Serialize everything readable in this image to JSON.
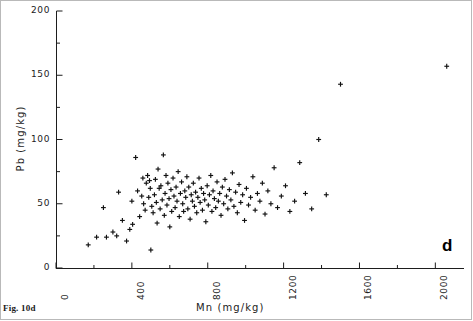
{
  "figure": {
    "caption": "Fig. 10d",
    "panel_letter": "d"
  },
  "chart_data": {
    "type": "scatter",
    "title": "",
    "xlabel": "Mn (mg/kg)",
    "ylabel": "Pb (mg/kg)",
    "xlim": [
      0,
      2130
    ],
    "ylim": [
      0,
      200
    ],
    "xticks": [
      0,
      400,
      800,
      1200,
      1600,
      2000
    ],
    "xtick_labels": [
      "0",
      "400",
      "800",
      "1200",
      "1600",
      "2000"
    ],
    "x_minor_tick_step": 200,
    "yticks": [
      0,
      50,
      100,
      150,
      200
    ],
    "ytick_labels": [
      "0",
      "50",
      "100",
      "150",
      "200"
    ],
    "y_minor_tick_step": 25,
    "grid": false,
    "legend": null,
    "marker": "plus",
    "marker_color": "#111111",
    "series": [
      {
        "name": "Samples",
        "points": [
          [
            170,
            18
          ],
          [
            214,
            24
          ],
          [
            250,
            47
          ],
          [
            266,
            24
          ],
          [
            300,
            28
          ],
          [
            320,
            25
          ],
          [
            350,
            37
          ],
          [
            330,
            59
          ],
          [
            372,
            21
          ],
          [
            389,
            30
          ],
          [
            400,
            52
          ],
          [
            404,
            34
          ],
          [
            420,
            86
          ],
          [
            430,
            60
          ],
          [
            441,
            40
          ],
          [
            452,
            56
          ],
          [
            458,
            70
          ],
          [
            462,
            50
          ],
          [
            470,
            45
          ],
          [
            476,
            66
          ],
          [
            483,
            72
          ],
          [
            489,
            55
          ],
          [
            493,
            68
          ],
          [
            497,
            62
          ],
          [
            500,
            14
          ],
          [
            505,
            48
          ],
          [
            512,
            43
          ],
          [
            519,
            57
          ],
          [
            524,
            69
          ],
          [
            529,
            51
          ],
          [
            533,
            35
          ],
          [
            538,
            77
          ],
          [
            544,
            62
          ],
          [
            549,
            46
          ],
          [
            553,
            64
          ],
          [
            560,
            53
          ],
          [
            566,
            88
          ],
          [
            571,
            41
          ],
          [
            575,
            58
          ],
          [
            580,
            72
          ],
          [
            585,
            49
          ],
          [
            590,
            66
          ],
          [
            596,
            54
          ],
          [
            600,
            32
          ],
          [
            606,
            61
          ],
          [
            610,
            44
          ],
          [
            617,
            70
          ],
          [
            622,
            56
          ],
          [
            628,
            47
          ],
          [
            633,
            63
          ],
          [
            638,
            52
          ],
          [
            644,
            75
          ],
          [
            650,
            40
          ],
          [
            656,
            58
          ],
          [
            662,
            67
          ],
          [
            668,
            50
          ],
          [
            673,
            44
          ],
          [
            679,
            60
          ],
          [
            684,
            55
          ],
          [
            690,
            71
          ],
          [
            695,
            46
          ],
          [
            700,
            63
          ],
          [
            707,
            38
          ],
          [
            713,
            57
          ],
          [
            719,
            52
          ],
          [
            724,
            66
          ],
          [
            730,
            48
          ],
          [
            736,
            59
          ],
          [
            742,
            43
          ],
          [
            748,
            55
          ],
          [
            754,
            70
          ],
          [
            760,
            51
          ],
          [
            766,
            62
          ],
          [
            772,
            45
          ],
          [
            778,
            58
          ],
          [
            784,
            53
          ],
          [
            790,
            36
          ],
          [
            797,
            64
          ],
          [
            803,
            49
          ],
          [
            809,
            57
          ],
          [
            816,
            72
          ],
          [
            822,
            44
          ],
          [
            828,
            60
          ],
          [
            835,
            54
          ],
          [
            842,
            47
          ],
          [
            849,
            67
          ],
          [
            856,
            52
          ],
          [
            863,
            58
          ],
          [
            870,
            41
          ],
          [
            877,
            63
          ],
          [
            884,
            50
          ],
          [
            891,
            69
          ],
          [
            899,
            56
          ],
          [
            906,
            46
          ],
          [
            914,
            61
          ],
          [
            922,
            53
          ],
          [
            930,
            74
          ],
          [
            938,
            48
          ],
          [
            947,
            59
          ],
          [
            956,
            43
          ],
          [
            965,
            65
          ],
          [
            974,
            51
          ],
          [
            984,
            57
          ],
          [
            994,
            37
          ],
          [
            1004,
            62
          ],
          [
            1015,
            49
          ],
          [
            1026,
            55
          ],
          [
            1038,
            71
          ],
          [
            1050,
            45
          ],
          [
            1062,
            58
          ],
          [
            1075,
            52
          ],
          [
            1088,
            66
          ],
          [
            1102,
            42
          ],
          [
            1117,
            60
          ],
          [
            1133,
            50
          ],
          [
            1150,
            78
          ],
          [
            1168,
            47
          ],
          [
            1188,
            56
          ],
          [
            1210,
            64
          ],
          [
            1233,
            44
          ],
          [
            1258,
            52
          ],
          [
            1285,
            82
          ],
          [
            1315,
            58
          ],
          [
            1348,
            46
          ],
          [
            1385,
            100
          ],
          [
            1425,
            57
          ],
          [
            1500,
            143
          ],
          [
            2060,
            157
          ]
        ]
      }
    ]
  }
}
